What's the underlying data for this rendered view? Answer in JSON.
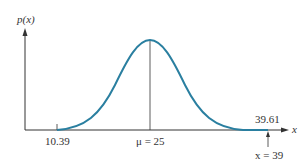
{
  "diagram": {
    "type": "normal-distribution",
    "y_axis_label": "p(x)",
    "x_axis_label": "x",
    "left_tick_label": "10.39",
    "mean_label": "μ = 25",
    "right_tick_label": "39.61",
    "pointer_label": "x = 39",
    "curve_color": "#2a7fa0",
    "axis_color": "#333333"
  }
}
